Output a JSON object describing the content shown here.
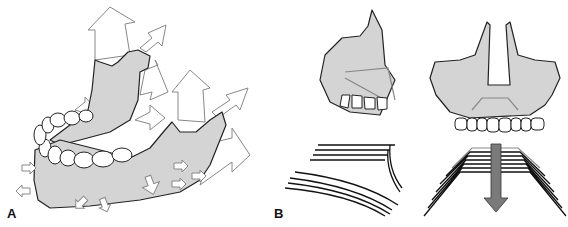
{
  "panels": [
    {
      "id": "A",
      "label": "A",
      "subject": "mandible-growth-arrows"
    },
    {
      "id": "B",
      "label": "B",
      "subject": "maxilla-lateral-frontal-and-growth-lines"
    }
  ],
  "colors": {
    "bone": "#d4d4d4",
    "outline": "#222222",
    "arrow_outline": "#888888",
    "down_arrow": "#7a7a7a"
  }
}
